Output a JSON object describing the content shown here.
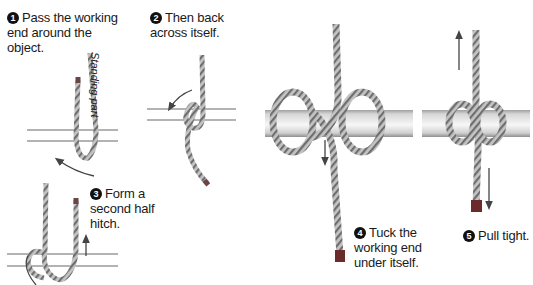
{
  "diagram": {
    "steps": [
      {
        "number": "1",
        "text_lines": [
          "Pass the working",
          "end around the",
          "object."
        ]
      },
      {
        "number": "2",
        "text_lines": [
          "Then back",
          "across itself."
        ]
      },
      {
        "number": "3",
        "text_lines": [
          "Form a",
          "second half",
          "hitch."
        ]
      },
      {
        "number": "4",
        "text_lines": [
          "Tuck the",
          "working end",
          "under itself."
        ]
      },
      {
        "number": "5",
        "text_lines": [
          "Pull tight."
        ]
      }
    ],
    "labels": {
      "standing_part": "Standing part"
    },
    "colors": {
      "rope_fill": "#b8b8b8",
      "rope_stripe": "#6e6e6e",
      "rope_end": "#6b2b2b",
      "pole_light": "#e8e8e8",
      "pole_dark": "#9a9a9a",
      "arrow": "#444444",
      "text": "#1a1a1a"
    }
  }
}
